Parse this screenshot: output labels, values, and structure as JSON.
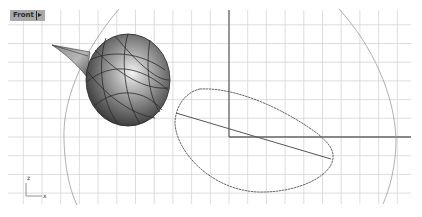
{
  "viewport": {
    "name": "Front",
    "menu_arrow": "▸",
    "background": "#ffffff",
    "grid": {
      "color": "#d2d2d2",
      "major_color": "#bcbcbc",
      "spacing_px": 18.7,
      "extent": {
        "x0": 8,
        "y0": 24,
        "x1": 411,
        "y1": 204
      },
      "axis_color": "#555555"
    },
    "world_axes": {
      "z_axis_x": 229,
      "x_axis_y": 137
    },
    "axis_indicator": {
      "vertical_label": "z",
      "horizontal_label": "x"
    },
    "objects": [
      {
        "type": "shaded-sphere-with-cone",
        "name": "teardrop-surface"
      },
      {
        "type": "curve",
        "name": "closed-blob-curve"
      },
      {
        "type": "line",
        "name": "diagonal-line"
      },
      {
        "type": "arc",
        "name": "large-circle-arc"
      }
    ]
  }
}
